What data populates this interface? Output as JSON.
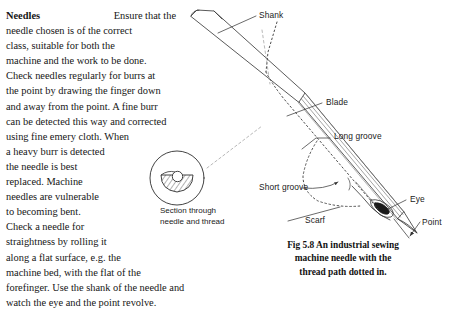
{
  "body": {
    "runhead": "Needles",
    "lines": [
      "Ensure that the",
      "needle chosen is of the correct",
      "class, suitable for both the",
      "machine and the work to be done.",
      "Check needles regularly for burrs at",
      "the point by drawing the finger down",
      "and away from the point. A fine burr",
      "can be detected this way and corrected",
      "using fine emery cloth. When",
      "a heavy burr is detected",
      "the needle is best",
      "replaced. Machine",
      "needles are vulnerable",
      "to becoming bent.",
      "Check a needle for",
      "straightness by rolling it",
      "along a flat surface, e.g. the",
      "machine bed, with the flat of the",
      "forefinger. Use the shank of the needle and",
      "watch the eye and the point revolve."
    ]
  },
  "labels": {
    "shank": "Shank",
    "blade": "Blade",
    "long_groove": "Long groove",
    "short_groove": "Short groove",
    "scarf": "Scarf",
    "eye": "Eye",
    "point": "Point"
  },
  "inset": {
    "caption_line1": "Section through",
    "caption_line2": "needle and thread"
  },
  "figure": {
    "caption_line1": "Fig 5.8 An industrial sewing",
    "caption_line2": "machine needle with the",
    "caption_line3": "thread path dotted in."
  },
  "colors": {
    "ink": "#1a1a1a",
    "line": "#4a4a4a",
    "hatch": "#555555",
    "paper": "#ffffff"
  }
}
